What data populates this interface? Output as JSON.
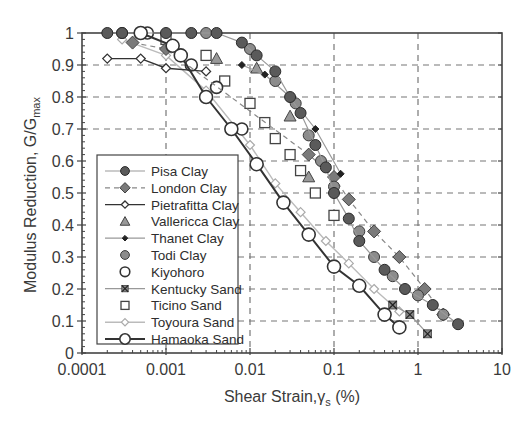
{
  "chart_data": {
    "type": "scatter",
    "title": "",
    "xlabel": "Shear Strain,γs (%)",
    "xlabel_main": "Shear Strain,γ",
    "xlabel_sub": "s",
    "xlabel_tail": " (%)",
    "ylabel": "Modulus Reduction, G/Gmax",
    "ylabel_main": "Modulus Reduction, G/G",
    "ylabel_sub": "max",
    "xscale": "log",
    "xlim": [
      0.0001,
      10
    ],
    "ylim": [
      0,
      1
    ],
    "xticks": [
      "0.0001",
      "0.001",
      "0.01",
      "0.1",
      "1",
      "10"
    ],
    "yticks": [
      "0",
      "0.1",
      "0.2",
      "0.3",
      "0.4",
      "0.5",
      "0.6",
      "0.7",
      "0.8",
      "0.9",
      "1"
    ],
    "grid": "dashed",
    "legend_position": "lower-left inside",
    "series": [
      {
        "name": "Pisa Clay",
        "marker": "circle-dark",
        "line": "thin-gray",
        "color": "#555555",
        "x": [
          0.0002,
          0.0003,
          0.001,
          0.002,
          0.004,
          0.008,
          0.012,
          0.02,
          0.03,
          0.04,
          0.06,
          0.08,
          0.1,
          0.15,
          0.2,
          0.4,
          0.7,
          1.5,
          3
        ],
        "y": [
          1.0,
          1.0,
          1.0,
          1.0,
          1.0,
          0.97,
          0.93,
          0.88,
          0.8,
          0.75,
          0.65,
          0.58,
          0.5,
          0.42,
          0.35,
          0.26,
          0.2,
          0.15,
          0.09
        ]
      },
      {
        "name": "London Clay",
        "marker": "diamond-gray",
        "line": "dashed-gray",
        "color": "#777777",
        "x": [
          0.0004,
          0.001,
          0.05,
          0.1,
          0.15,
          0.3,
          0.6,
          1.2,
          2
        ],
        "y": [
          0.97,
          0.95,
          0.62,
          0.55,
          0.48,
          0.38,
          0.3,
          0.2,
          0.12
        ]
      },
      {
        "name": "Pietrafitta Clay",
        "marker": "diamond-open-small",
        "line": "solid-dark",
        "color": "#444444",
        "x": [
          0.0002,
          0.0005,
          0.001,
          0.003
        ],
        "y": [
          0.92,
          0.92,
          0.89,
          0.88
        ]
      },
      {
        "name": "Vallericca Clay",
        "marker": "triangle-gray",
        "line": "none",
        "color": "#888888",
        "x": [
          0.004,
          0.012,
          0.03,
          0.05
        ],
        "y": [
          0.92,
          0.89,
          0.74,
          0.55
        ]
      },
      {
        "name": "Thanet Clay",
        "marker": "dot-small-dark",
        "line": "thin-gray",
        "color": "#333333",
        "x": [
          0.008,
          0.015,
          0.03,
          0.06,
          0.12
        ],
        "y": [
          0.9,
          0.87,
          0.8,
          0.7,
          0.56
        ]
      },
      {
        "name": "Todi Clay",
        "marker": "circle-gray",
        "line": "none",
        "color": "#8a8a8a",
        "x": [
          0.0003,
          0.003,
          0.01,
          0.02,
          0.035,
          0.05,
          0.07,
          0.1,
          0.2,
          0.3,
          0.5,
          1,
          2
        ],
        "y": [
          1.0,
          1.0,
          0.95,
          0.85,
          0.78,
          0.68,
          0.6,
          0.52,
          0.38,
          0.3,
          0.24,
          0.18,
          0.12
        ]
      },
      {
        "name": "Kiyohoro",
        "marker": "circle-open",
        "line": "none",
        "color": "#333333",
        "x": [
          0.0006,
          0.002,
          0.004,
          0.008
        ],
        "y": [
          1.0,
          0.9,
          0.83,
          0.7
        ]
      },
      {
        "name": "Kentucky Sand",
        "marker": "x-box",
        "line": "thin-gray",
        "color": "#555555",
        "x": [
          0.5,
          0.8,
          1.3
        ],
        "y": [
          0.15,
          0.12,
          0.06
        ]
      },
      {
        "name": "Ticino Sand",
        "marker": "square-open",
        "line": "none",
        "color": "#444444",
        "x": [
          0.001,
          0.003,
          0.005,
          0.01,
          0.015,
          0.02,
          0.03,
          0.04,
          0.06,
          0.1
        ],
        "y": [
          0.98,
          0.93,
          0.85,
          0.78,
          0.72,
          0.67,
          0.62,
          0.57,
          0.5,
          0.43
        ]
      },
      {
        "name": "Toyoura Sand",
        "marker": "diamond-open-light",
        "line": "thin-light",
        "color": "#aaaaaa",
        "x": [
          0.0003,
          0.001,
          0.003,
          0.01,
          0.02,
          0.04,
          0.08,
          0.15,
          0.3,
          0.6
        ],
        "y": [
          0.98,
          0.93,
          0.82,
          0.65,
          0.53,
          0.44,
          0.35,
          0.28,
          0.2,
          0.13
        ]
      },
      {
        "name": "Hamaoka Sand",
        "marker": "circle-open-large",
        "line": "solid-thick-dark",
        "color": "#333333",
        "x": [
          0.0005,
          0.0012,
          0.0015,
          0.003,
          0.006,
          0.012,
          0.025,
          0.05,
          0.1,
          0.2,
          0.4,
          0.6
        ],
        "y": [
          1.0,
          0.96,
          0.93,
          0.8,
          0.7,
          0.59,
          0.47,
          0.37,
          0.27,
          0.21,
          0.12,
          0.08
        ]
      }
    ]
  }
}
